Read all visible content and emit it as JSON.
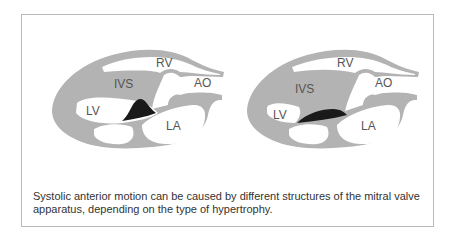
{
  "figure": {
    "panels": [
      {
        "id": "left",
        "labels": {
          "rv": "RV",
          "ivs": "IVS",
          "ao": "AO",
          "lv": "LV",
          "la": "LA"
        },
        "sam_shape": "peaked"
      },
      {
        "id": "right",
        "labels": {
          "rv": "RV",
          "ivs": "IVS",
          "ao": "AO",
          "lv": "LV",
          "la": "LA"
        },
        "sam_shape": "elongated"
      }
    ],
    "colors": {
      "tissue": "#b3b3b3",
      "chamber": "#ffffff",
      "sam": "#1a1a1a",
      "frame": "#b9b9b9",
      "text": "#333333"
    },
    "caption": "Systolic anterior motion can be caused by different structures of the mitral valve apparatus, depending on the type of hypertrophy."
  }
}
